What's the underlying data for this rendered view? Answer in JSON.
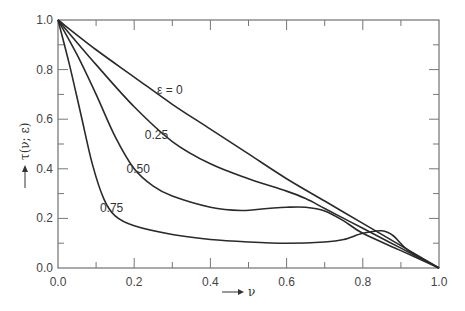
{
  "chart_data": {
    "type": "line",
    "title": "",
    "xlabel": "ν",
    "ylabel": "τ(ν; ε)",
    "xlim": [
      0.0,
      1.0
    ],
    "ylim": [
      0.0,
      1.0
    ],
    "grid": false,
    "legend": "inline curve labels",
    "x_ticks": [
      "0.0",
      "0.2",
      "0.4",
      "0.6",
      "0.8",
      "1.0"
    ],
    "y_ticks": [
      "0.0",
      "0.2",
      "0.4",
      "0.6",
      "0.8",
      "1.0"
    ],
    "series": [
      {
        "name": "ε = 0",
        "label": "ε = 0",
        "label_pos": [
          0.26,
          0.7
        ],
        "x": [
          0.0,
          0.1,
          0.2,
          0.3,
          0.4,
          0.5,
          0.6,
          0.7,
          0.8,
          0.9,
          1.0
        ],
        "y": [
          1.0,
          0.88,
          0.77,
          0.66,
          0.56,
          0.46,
          0.36,
          0.27,
          0.18,
          0.09,
          0.0
        ]
      },
      {
        "name": "ε = 0.25",
        "label": "0.25",
        "label_pos": [
          0.228,
          0.52
        ],
        "x": [
          0.0,
          0.1,
          0.2,
          0.3,
          0.4,
          0.5,
          0.6,
          0.65,
          0.7,
          0.75,
          0.8,
          0.9,
          1.0
        ],
        "y": [
          1.0,
          0.82,
          0.65,
          0.51,
          0.42,
          0.36,
          0.31,
          0.28,
          0.24,
          0.2,
          0.16,
          0.08,
          0.0
        ]
      },
      {
        "name": "ε = 0.50",
        "label": "0.50",
        "label_pos": [
          0.18,
          0.385
        ],
        "x": [
          0.0,
          0.05,
          0.1,
          0.15,
          0.2,
          0.25,
          0.3,
          0.4,
          0.48,
          0.55,
          0.6,
          0.65,
          0.7,
          0.75,
          0.8,
          0.9,
          1.0
        ],
        "y": [
          1.0,
          0.86,
          0.7,
          0.53,
          0.4,
          0.33,
          0.29,
          0.245,
          0.232,
          0.24,
          0.245,
          0.245,
          0.23,
          0.19,
          0.14,
          0.07,
          0.0
        ]
      },
      {
        "name": "ε = 0.75",
        "label": "0.75",
        "label_pos": [
          0.11,
          0.225
        ],
        "x": [
          0.0,
          0.03,
          0.06,
          0.09,
          0.12,
          0.15,
          0.2,
          0.3,
          0.4,
          0.5,
          0.6,
          0.7,
          0.75,
          0.8,
          0.85,
          0.88,
          0.92,
          1.0
        ],
        "y": [
          1.0,
          0.82,
          0.62,
          0.42,
          0.28,
          0.21,
          0.17,
          0.135,
          0.115,
          0.105,
          0.1,
          0.105,
          0.115,
          0.14,
          0.15,
          0.13,
          0.07,
          0.0
        ]
      }
    ]
  },
  "axes": {
    "x_arrow_label": "ν",
    "y_arrow_label": "τ(ν; ε)"
  }
}
